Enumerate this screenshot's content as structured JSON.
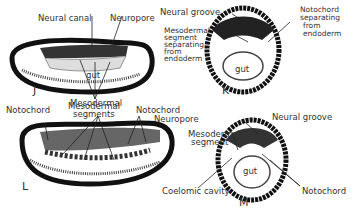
{
  "figure": {
    "panels": {
      "J": {
        "letter": "J",
        "labels": {
          "neural_canal": "Neural canal",
          "neuropore": "Neuropore",
          "gut": "gut",
          "mesodermal": "Mesodermal"
        }
      },
      "K": {
        "letter": "K",
        "labels": {
          "neural_groove": "Neural groove",
          "mesodermal_segment": [
            "Mesodermal",
            "segment",
            "separating",
            "from",
            "endoderm"
          ],
          "notochord": [
            "Notochord",
            "separating",
            "from",
            "endoderm"
          ],
          "gut": "gut"
        }
      },
      "L": {
        "letter": "L",
        "labels": {
          "notochord_left": "Notochord",
          "mesodermal_segments": [
            "Mesodermal",
            "segments"
          ],
          "notochord_right": "Notochord",
          "neuropore": "Neuropore"
        }
      },
      "M": {
        "letter": "M",
        "labels": {
          "neural_groove": "Neural groove",
          "mesodermal_segment": [
            "Mesodermal",
            "segment"
          ],
          "coelomic_cavity": "Coelomic cavity",
          "notochord": "Notochord",
          "gut": "gut"
        }
      }
    }
  }
}
